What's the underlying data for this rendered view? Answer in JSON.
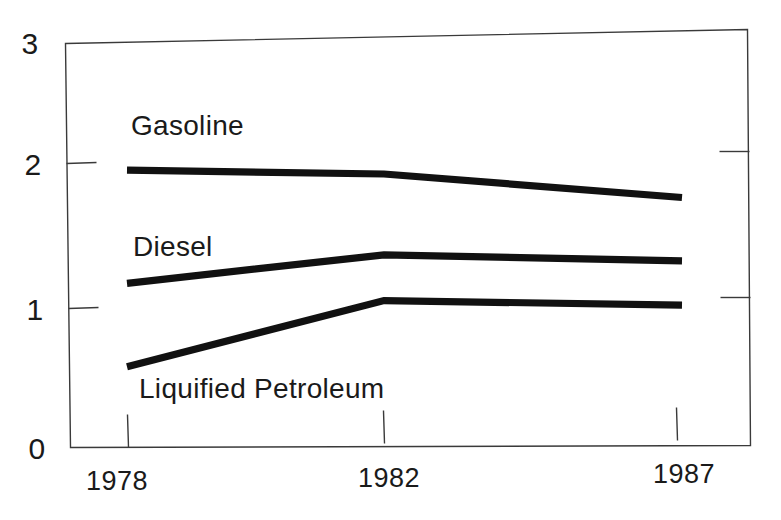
{
  "chart_data": {
    "type": "line",
    "title": "",
    "subtitle": "",
    "xlabel": "",
    "ylabel": "",
    "x": [
      1978,
      1982,
      1987
    ],
    "categories": [
      "1978",
      "1982",
      "1987"
    ],
    "xtick_labels": [
      "1978",
      "1982",
      "1987"
    ],
    "ytick_labels": [
      "0",
      "1",
      "2",
      "3"
    ],
    "ytick_values": [
      0,
      1,
      2,
      3
    ],
    "ylim": [
      0,
      3
    ],
    "xlim": [
      1978,
      1987
    ],
    "grid": false,
    "legend": "inline-labels",
    "legend_position": "inline",
    "series": [
      {
        "name": "Gasoline",
        "label": "Gasoline",
        "values": [
          2.05,
          2.0,
          1.8
        ],
        "color": "#111111",
        "label_x": 1978.3,
        "label_y": 2.42
      },
      {
        "name": "Diesel",
        "label": "Diesel",
        "values": [
          1.21,
          1.4,
          1.33
        ],
        "color": "#111111",
        "label_x": 1978.4,
        "label_y": 1.56
      },
      {
        "name": "Liquified Petroleum",
        "label": "Liquified Petroleum",
        "values": [
          0.59,
          1.06,
          1.0
        ],
        "color": "#111111",
        "label_x": 1978.5,
        "label_y": 0.43
      }
    ],
    "annotations": [],
    "axis_ticks": {
      "left": [
        0,
        1,
        2,
        3
      ],
      "right": [
        1,
        2
      ],
      "bottom": [
        1978,
        1982,
        1987
      ],
      "top": []
    }
  },
  "axis": {
    "y": {
      "tick_0": "0",
      "tick_1": "1",
      "tick_2": "2",
      "tick_3": "3"
    },
    "x": {
      "tick_1978": "1978",
      "tick_1982": "1982",
      "tick_1987": "1987"
    }
  },
  "series_labels": {
    "gasoline": "Gasoline",
    "diesel": "Diesel",
    "lpg": "Liquified Petroleum"
  },
  "colors": {
    "line": "#111111",
    "frame": "#3a3a3a",
    "background": "#ffffff",
    "text": "#1a1a1a"
  }
}
